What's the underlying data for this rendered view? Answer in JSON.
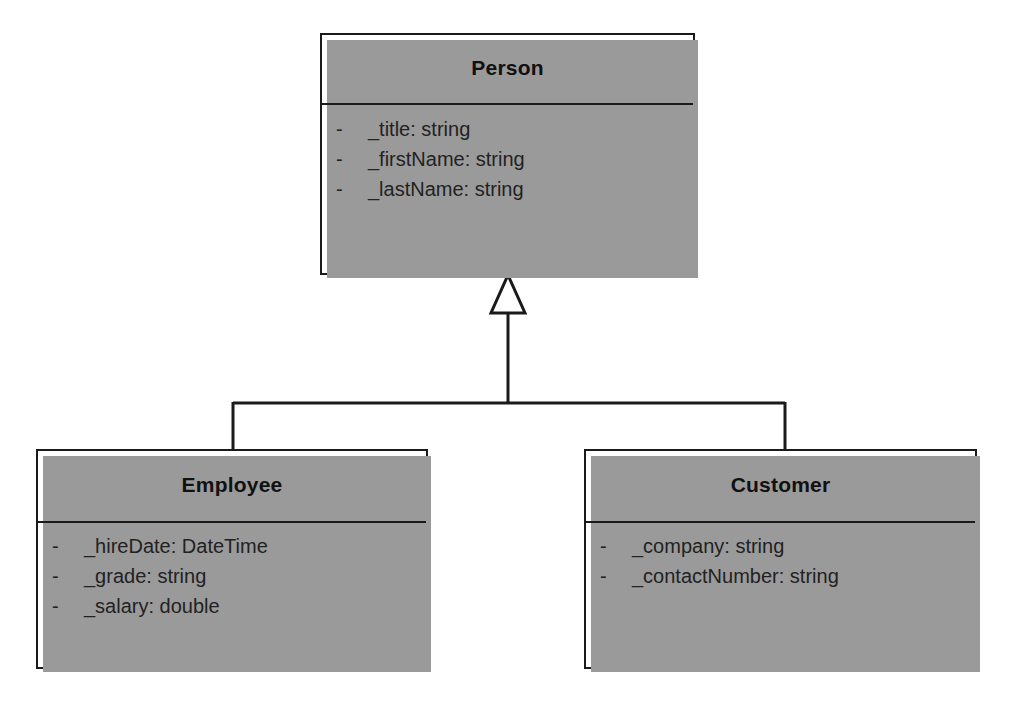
{
  "diagram": {
    "type": "uml-class-diagram",
    "relationship": "generalization",
    "background_color": "#ffffff",
    "line_color": "#1a1a1a",
    "shadow_color": "#9a9a9a"
  },
  "classes": [
    {
      "id": "person",
      "name": "Person",
      "role": "superclass",
      "attributes": [
        {
          "visibility": "-",
          "text": "_title:  string"
        },
        {
          "visibility": "-",
          "text": "_firstName:  string"
        },
        {
          "visibility": "-",
          "text": "_lastName:  string"
        }
      ]
    },
    {
      "id": "employee",
      "name": "Employee",
      "role": "subclass",
      "attributes": [
        {
          "visibility": "-",
          "text": "_hireDate:  DateTime"
        },
        {
          "visibility": "-",
          "text": "_grade:  string"
        },
        {
          "visibility": "-",
          "text": "_salary:  double"
        }
      ]
    },
    {
      "id": "customer",
      "name": "Customer",
      "role": "subclass",
      "attributes": [
        {
          "visibility": "-",
          "text": "_company:  string"
        },
        {
          "visibility": "-",
          "text": "_contactNumber:  string"
        }
      ]
    }
  ]
}
